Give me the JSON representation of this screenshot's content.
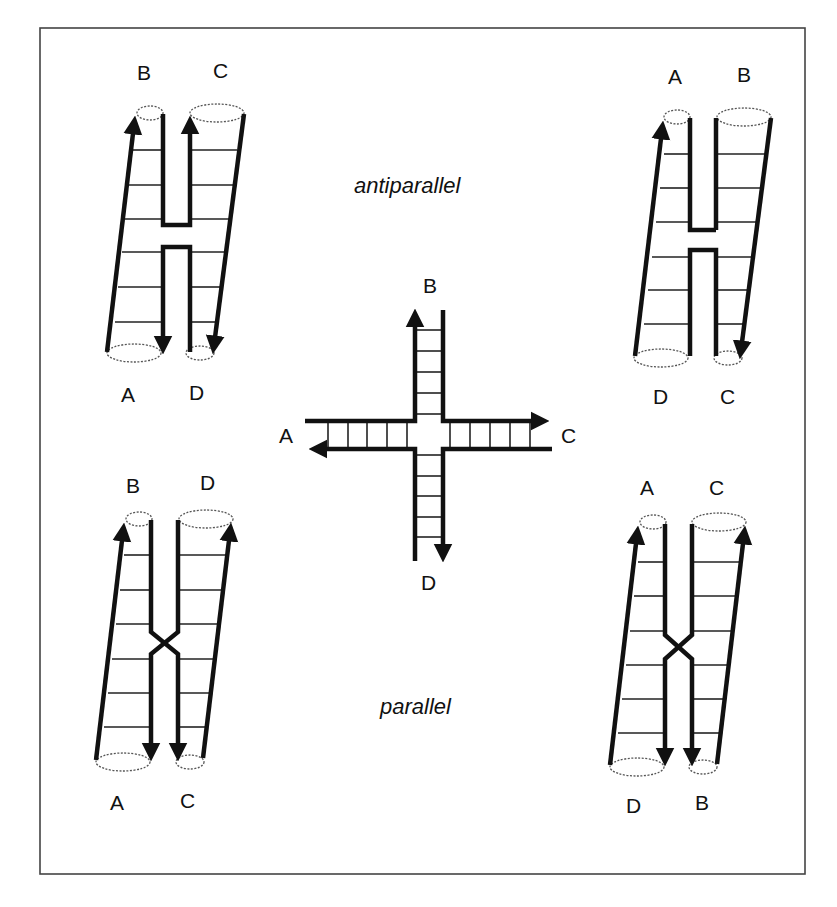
{
  "figure": {
    "captions": {
      "antiparallel": "antiparallel",
      "parallel": "parallel"
    },
    "center_junction": {
      "labels": {
        "top": "B",
        "left": "A",
        "right": "C",
        "bottom": "D"
      }
    },
    "top_left": {
      "type": "antiparallel stacked",
      "labels": {
        "top_left": "B",
        "top_right": "C",
        "bottom_left": "A",
        "bottom_right": "D"
      }
    },
    "top_right": {
      "type": "antiparallel stacked",
      "labels": {
        "top_left": "A",
        "top_right": "B",
        "bottom_left": "D",
        "bottom_right": "C"
      }
    },
    "bottom_left": {
      "type": "parallel stacked",
      "labels": {
        "top_left": "B",
        "top_right": "D",
        "bottom_left": "A",
        "bottom_right": "C"
      }
    },
    "bottom_right": {
      "type": "parallel stacked",
      "labels": {
        "top_left": "A",
        "top_right": "C",
        "bottom_left": "D",
        "bottom_right": "B"
      }
    },
    "colors": {
      "ink": "#111111",
      "background": "#ffffff",
      "frame": "#444444"
    }
  }
}
